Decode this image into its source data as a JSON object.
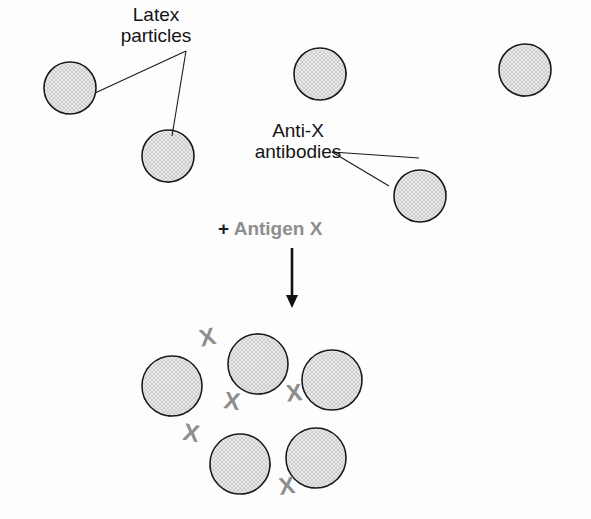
{
  "figure": {
    "labels": {
      "latex_particles": "Latex\nparticles",
      "anti_x_antibodies": "Anti-X\nantibodies",
      "antigen_plus": "+ ",
      "antigen_text": "Antigen X"
    },
    "antigen_mark": "X",
    "colors": {
      "background": "#fdfdfd",
      "particle_fill": "#ebebeb",
      "particle_stipple": "#b9b9b9",
      "particle_outline": "#1a1a1a",
      "antibody_fill": "#5e5e5e",
      "antibody_outline": "#2b2b2b",
      "antigen_x": "#8e8e8e",
      "text": "#141414",
      "antigen_label": "#8e8e8e",
      "leader_line": "#1a1a1a",
      "arrow": "#111111"
    },
    "free_particles": [
      {
        "id": "p1",
        "cx": 70,
        "cy": 88,
        "r": 26,
        "angles": [
          20,
          75,
          135,
          190,
          250,
          310
        ]
      },
      {
        "id": "p2",
        "cx": 168,
        "cy": 156,
        "r": 26,
        "angles": [
          10,
          62,
          120,
          178,
          238,
          300
        ]
      },
      {
        "id": "p3",
        "cx": 320,
        "cy": 74,
        "r": 26,
        "angles": [
          30,
          88,
          140,
          196,
          252,
          315
        ]
      },
      {
        "id": "p4",
        "cx": 525,
        "cy": 70,
        "r": 26,
        "angles": [
          18,
          72,
          128,
          185,
          244,
          302
        ]
      },
      {
        "id": "p5",
        "cx": 420,
        "cy": 196,
        "r": 26,
        "angles": [
          28,
          80,
          142,
          200,
          258,
          318
        ]
      }
    ],
    "cluster_particles": [
      {
        "id": "c1",
        "cx": 172,
        "cy": 386,
        "r": 30,
        "angles": [
          15,
          68,
          128,
          185,
          245,
          305
        ]
      },
      {
        "id": "c2",
        "cx": 258,
        "cy": 364,
        "r": 30,
        "angles": [
          0,
          58,
          118,
          175,
          238,
          300
        ]
      },
      {
        "id": "c3",
        "cx": 332,
        "cy": 380,
        "r": 30,
        "angles": [
          22,
          80,
          140,
          198,
          255,
          315
        ]
      },
      {
        "id": "c4",
        "cx": 240,
        "cy": 464,
        "r": 30,
        "angles": [
          35,
          92,
          150,
          205,
          262,
          320
        ]
      },
      {
        "id": "c5",
        "cx": 316,
        "cy": 458,
        "r": 30,
        "angles": [
          12,
          70,
          130,
          188,
          248,
          308
        ]
      }
    ],
    "antigen_marks": [
      {
        "x": 209,
        "y": 345,
        "rot": -12
      },
      {
        "x": 231,
        "y": 409,
        "rot": 8
      },
      {
        "x": 295,
        "y": 401,
        "rot": -6
      },
      {
        "x": 190,
        "y": 441,
        "rot": 10
      },
      {
        "x": 288,
        "y": 494,
        "rot": -8
      }
    ],
    "leader_lines": {
      "latex_to_p1": {
        "x1": 186,
        "y1": 51,
        "x2": 95,
        "y2": 93
      },
      "latex_to_p2": {
        "x1": 186,
        "y1": 51,
        "x2": 172,
        "y2": 136
      },
      "anti_to_particle": {
        "x1": 332,
        "y1": 152,
        "x2": 419,
        "y2": 158
      },
      "anti_to_particle2": {
        "x1": 332,
        "y1": 152,
        "x2": 389,
        "y2": 186
      }
    },
    "arrow": {
      "x": 292,
      "y1": 248,
      "y2": 308
    }
  }
}
